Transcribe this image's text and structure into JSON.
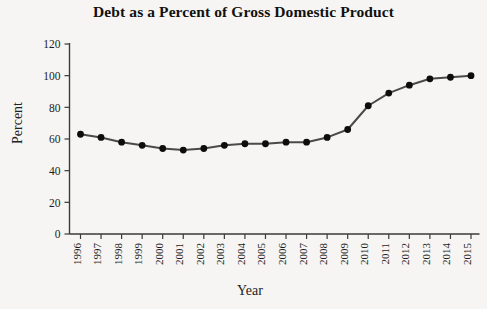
{
  "chart_data": {
    "type": "line",
    "title": "Debt as a Percent of Gross Domestic Product",
    "xlabel": "Year",
    "ylabel": "Percent",
    "categories": [
      "1996",
      "1997",
      "1998",
      "1999",
      "2000",
      "2001",
      "2002",
      "2003",
      "2004",
      "2005",
      "2006",
      "2007",
      "2008",
      "2009",
      "2010",
      "2011",
      "2012",
      "2013",
      "2014",
      "2015"
    ],
    "values": [
      63,
      61,
      58,
      56,
      54,
      53,
      54,
      56,
      57,
      57,
      58,
      58,
      61,
      66,
      81,
      89,
      94,
      98,
      99,
      100
    ],
    "x": [
      1996,
      1997,
      1998,
      1999,
      2000,
      2001,
      2002,
      2003,
      2004,
      2005,
      2006,
      2007,
      2008,
      2009,
      2010,
      2011,
      2012,
      2013,
      2014,
      2015
    ],
    "ylim": [
      0,
      120
    ],
    "xlim": [
      1996,
      2015
    ],
    "yticks": [
      "0",
      "20",
      "40",
      "60",
      "80",
      "100",
      "120"
    ],
    "ytick_values": [
      0,
      20,
      40,
      60,
      80,
      100,
      120
    ],
    "grid": false,
    "legend": "none",
    "marker": "filled-circle",
    "line_color": "#4a4a4a",
    "marker_color": "#0d0d0d",
    "background_color": "#f6f5f3",
    "axis_color": "#3a3a3a"
  }
}
